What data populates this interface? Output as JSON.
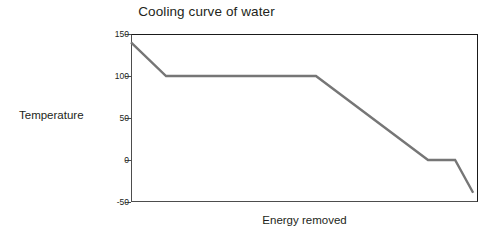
{
  "chart_data": {
    "type": "line",
    "title": "Cooling curve of water",
    "xlabel": "Energy removed",
    "ylabel": "Temperature",
    "grid": false,
    "legend": null,
    "xlim": [
      0,
      100
    ],
    "ylim": [
      -50,
      150
    ],
    "x_tick_labels": [],
    "y_tick_labels": [
      "150",
      "100",
      "50",
      "0",
      "-50"
    ],
    "y_tick_values": [
      150,
      100,
      50,
      0,
      -50
    ],
    "line_color": "#767676",
    "axis_color": "#4d4d4d",
    "frame_color": "#1a1a1a",
    "text_color": "#231f20",
    "series": [
      {
        "name": "Cooling curve of water",
        "x": [
          0.0,
          10.1,
          53.3,
          85.6,
          93.4,
          98.6
        ],
        "y": [
          140,
          100,
          100,
          0,
          0,
          -39
        ]
      }
    ],
    "annotations": []
  }
}
